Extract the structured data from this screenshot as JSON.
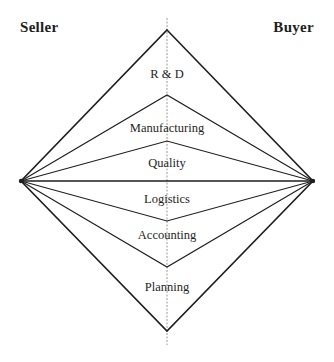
{
  "diagram": {
    "title": "",
    "left_party": "Seller",
    "right_party": "Buyer",
    "bands": [
      {
        "label": "R & D",
        "label_y": 68
      },
      {
        "label": "Manufacturing",
        "label_y": 122
      },
      {
        "label": "Quality",
        "label_y": 157
      },
      {
        "label": "Logistics",
        "label_y": 193
      },
      {
        "label": "Accounting",
        "label_y": 229
      },
      {
        "label": "Planning",
        "label_y": 281
      }
    ],
    "vertices": {
      "top": [
        167,
        30
      ],
      "bottom": [
        167,
        331
      ],
      "left": [
        21,
        181
      ],
      "right": [
        313,
        181
      ]
    },
    "divider_center_y": [
      95,
      141,
      181,
      221,
      267
    ],
    "colors": {
      "line": "#1e1e1e",
      "center_axis": "#9a9a9a",
      "background": "#ffffff"
    }
  }
}
